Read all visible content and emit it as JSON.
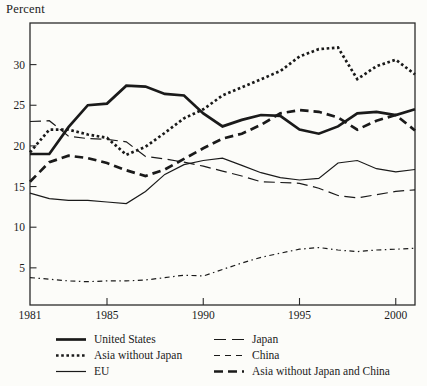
{
  "chart_data": {
    "type": "line",
    "ylabel": "Percent",
    "x": [
      1981,
      1982,
      1983,
      1984,
      1985,
      1986,
      1987,
      1988,
      1989,
      1990,
      1991,
      1992,
      1993,
      1994,
      1995,
      1996,
      1997,
      1998,
      1999,
      2000,
      2001
    ],
    "x_ticks": [
      1981,
      1985,
      1990,
      1995,
      2000
    ],
    "y_ticks": [
      5,
      10,
      15,
      20,
      25,
      30
    ],
    "xlim": [
      1981,
      2001
    ],
    "ylim": [
      0,
      35
    ],
    "grid": false,
    "line_color": "#1a1a1a",
    "frame_color": "#2b2b2b",
    "legend_position": "bottom-two-columns",
    "series": [
      {
        "name": "United States",
        "key": "united-states",
        "color": "#1a1a1a",
        "stroke_width": 2.7,
        "dash": "",
        "legend_dash": "",
        "values": [
          19.0,
          19.0,
          22.3,
          25.0,
          25.2,
          27.4,
          27.3,
          26.4,
          26.2,
          24.0,
          22.4,
          23.2,
          23.8,
          23.7,
          22.0,
          21.5,
          22.4,
          24.0,
          24.2,
          23.8,
          24.5
        ]
      },
      {
        "name": "Asia without Japan",
        "key": "asia-without-japan",
        "color": "#1a1a1a",
        "stroke_width": 2.7,
        "dash": "2.6 2.6",
        "legend_dash": "2.6 2.6",
        "values": [
          19.2,
          22.0,
          22.0,
          21.4,
          21.0,
          18.9,
          19.9,
          21.6,
          23.4,
          24.5,
          26.2,
          27.2,
          28.2,
          29.2,
          31.0,
          31.9,
          32.1,
          28.2,
          29.8,
          30.6,
          28.8
        ]
      },
      {
        "name": "EU",
        "key": "eu",
        "color": "#1a1a1a",
        "stroke_width": 1.2,
        "dash": "",
        "legend_dash": "",
        "values": [
          14.2,
          13.5,
          13.3,
          13.3,
          13.1,
          12.9,
          14.4,
          16.5,
          17.7,
          18.2,
          18.5,
          17.6,
          16.7,
          16.1,
          15.8,
          16.0,
          17.9,
          18.2,
          17.2,
          16.8,
          17.1
        ]
      },
      {
        "name": "Japan",
        "key": "japan",
        "color": "#1a1a1a",
        "stroke_width": 1.2,
        "dash": "11 5.5",
        "legend_dash": "12 6",
        "values": [
          23.0,
          23.1,
          21.2,
          20.9,
          20.8,
          20.5,
          18.7,
          18.4,
          18.0,
          17.5,
          16.9,
          16.3,
          15.6,
          15.5,
          15.4,
          14.8,
          13.9,
          13.6,
          14.0,
          14.4,
          14.6
        ]
      },
      {
        "name": "China",
        "key": "china",
        "color": "#1a1a1a",
        "stroke_width": 1.2,
        "dash": "5 3.5 1.5 3.5",
        "legend_dash": "6 5",
        "values": [
          3.8,
          3.6,
          3.4,
          3.3,
          3.4,
          3.4,
          3.5,
          3.8,
          4.1,
          4.0,
          4.8,
          5.6,
          6.3,
          6.8,
          7.3,
          7.5,
          7.2,
          7.0,
          7.2,
          7.3,
          7.4
        ]
      },
      {
        "name": "Asia without Japan and China",
        "key": "asia-without-japan-and-china",
        "color": "#1a1a1a",
        "stroke_width": 2.7,
        "dash": "8.5 5",
        "legend_dash": "9 5",
        "values": [
          15.6,
          18.0,
          18.8,
          18.5,
          17.9,
          17.0,
          16.3,
          17.1,
          18.4,
          19.7,
          20.9,
          21.5,
          22.6,
          24.0,
          24.4,
          24.2,
          23.5,
          22.0,
          23.1,
          23.8,
          21.9
        ]
      }
    ]
  }
}
